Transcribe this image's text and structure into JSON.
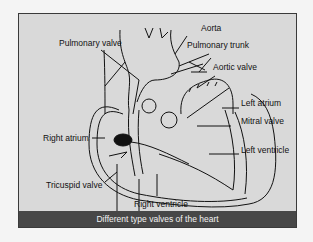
{
  "figure": {
    "caption": "Different type valves of the heart",
    "colors": {
      "panel_background": "#d9d9d9",
      "caption_background": "#474747",
      "caption_text": "#f2f2f2",
      "line": "#111111"
    },
    "labels": {
      "aorta": "Aorta",
      "pulmonary_valve": "Pulmonary valve",
      "pulmonary_trunk": "Pulmonary trunk",
      "aortic_valve": "Aortic valve",
      "left_atrium": "Left atrium",
      "mitral_valve": "Mitral valve",
      "right_atrium": "Right atrium",
      "left_ventricle": "Left ventricle",
      "tricuspid_valve": "Tricuspid valve",
      "right_ventricle": "Right ventricle"
    }
  }
}
